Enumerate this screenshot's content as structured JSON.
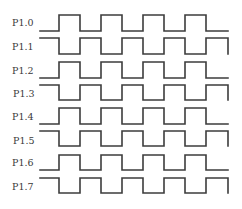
{
  "diagram": {
    "type": "timing-diagram",
    "colors": {
      "background": "#ffffff",
      "line": "#3c3c3c",
      "label": "#3a3a3a"
    },
    "x_start": 40,
    "x_end": 228,
    "edges": [
      59,
      80,
      101,
      122,
      143,
      164,
      185,
      206
    ],
    "signals": [
      {
        "label": "P1.0",
        "high_y": 15,
        "low_y": 31,
        "start_level": "low",
        "end_drop": false
      },
      {
        "label": "P1.1",
        "high_y": 38,
        "low_y": 54,
        "start_level": "high",
        "end_drop": true
      },
      {
        "label": "P1.2",
        "high_y": 62,
        "low_y": 78,
        "start_level": "low",
        "end_drop": false
      },
      {
        "label": "P1.3",
        "high_y": 85,
        "low_y": 100,
        "start_level": "high",
        "end_drop": true
      },
      {
        "label": "P1.4",
        "high_y": 108,
        "low_y": 124,
        "start_level": "low",
        "end_drop": false
      },
      {
        "label": "P1.5",
        "high_y": 131,
        "low_y": 146,
        "start_level": "high",
        "end_drop": true
      },
      {
        "label": "P1.6",
        "high_y": 155,
        "low_y": 170,
        "start_level": "low",
        "end_drop": false
      },
      {
        "label": "P1.7",
        "high_y": 178,
        "low_y": 193,
        "start_level": "high",
        "end_drop": true
      }
    ]
  }
}
